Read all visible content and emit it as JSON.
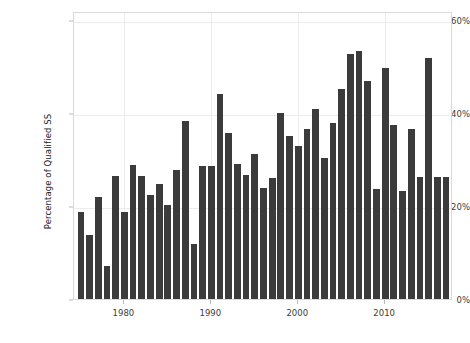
{
  "chart_data": {
    "type": "bar",
    "title": "",
    "subtitle": "",
    "xlabel": "",
    "ylabel": "Percentage of Qualified SS",
    "grid": true,
    "legend": null,
    "bar_color": "#3b3b3b",
    "background_color": "#ffffff",
    "axis_color": "#d9d9d9",
    "grid_color": "#ececec",
    "xlim": [
      1974.2,
      2017.8
    ],
    "ylim": [
      0,
      62
    ],
    "ytick_labels": [
      "0%",
      "20%",
      "40%",
      "60%"
    ],
    "ytick_values": [
      0,
      20,
      40,
      60
    ],
    "xtick_labels": [
      "1980",
      "1990",
      "2000",
      "2010"
    ],
    "xtick_values": [
      1980,
      1990,
      2000,
      2010
    ],
    "categories": [
      1975,
      1976,
      1977,
      1978,
      1979,
      1980,
      1981,
      1982,
      1983,
      1984,
      1985,
      1986,
      1987,
      1988,
      1989,
      1990,
      1991,
      1992,
      1993,
      1994,
      1995,
      1996,
      1997,
      1998,
      1999,
      2000,
      2001,
      2002,
      2003,
      2004,
      2005,
      2006,
      2007,
      2008,
      2009,
      2010,
      2011,
      2012,
      2013,
      2014,
      2015,
      2016,
      2017
    ],
    "values": [
      18.8,
      13.8,
      21.9,
      7.1,
      26.5,
      18.8,
      28.8,
      26.4,
      22.3,
      24.8,
      20.2,
      27.8,
      38.4,
      11.8,
      28.7,
      28.7,
      44.1,
      35.8,
      29.0,
      26.7,
      31.3,
      24.0,
      26.1,
      40.0,
      35.2,
      33.0,
      36.6,
      40.9,
      30.3,
      37.9,
      45.2,
      52.7,
      53.4,
      47.0,
      23.7,
      49.8,
      37.5,
      23.3,
      36.5,
      26.3,
      51.8,
      26.3,
      26.3
    ],
    "units": "percent"
  },
  "axes": {
    "y_title": "Percentage of Qualified SS"
  }
}
